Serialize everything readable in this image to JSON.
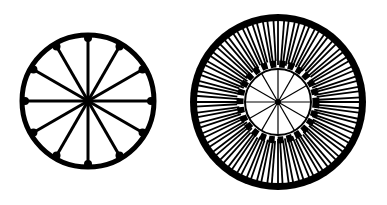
{
  "figures": [
    {
      "name": "simple-wheel",
      "cx": 88,
      "cy": 101,
      "r": 66,
      "spokes": 12,
      "stroke": "#000000"
    },
    {
      "name": "dense-wheel",
      "cx": 278,
      "cy": 102,
      "r": 88,
      "inner_r": 33,
      "inner_spokes": 12,
      "outer_rays": 96,
      "stroke": "#000000"
    }
  ],
  "colors": {
    "background": "#ffffff",
    "ink": "#000000"
  }
}
